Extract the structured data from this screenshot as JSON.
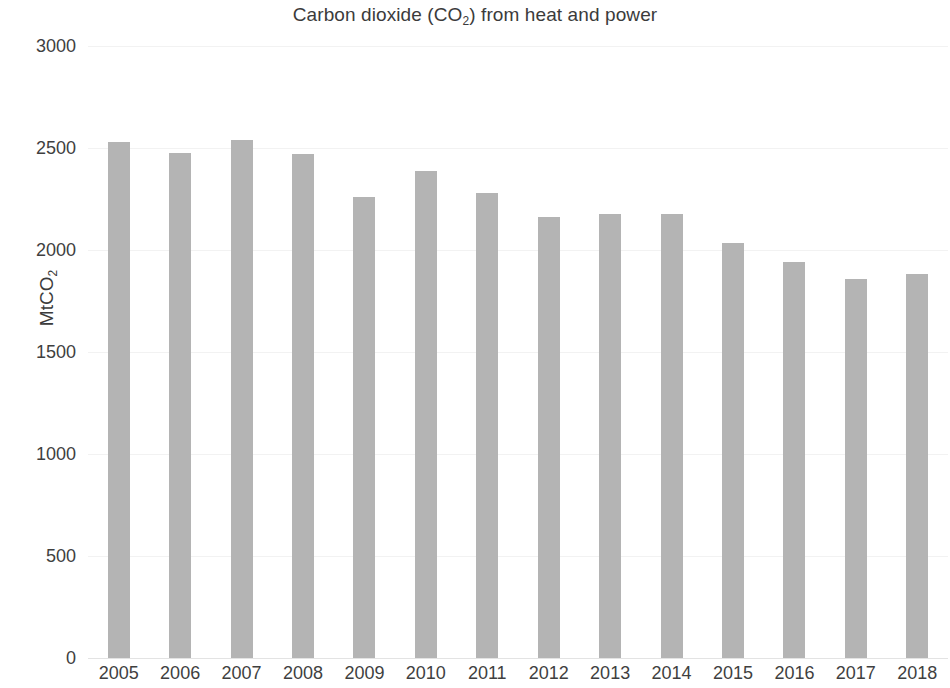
{
  "chart_data": {
    "type": "bar",
    "title": "Carbon dioxide (CO2) from heat and power",
    "title_prefix": "Carbon dioxide (CO",
    "title_sub": "2",
    "title_suffix": ") from heat and power",
    "xlabel": "",
    "ylabel": "MtCO2",
    "ylabel_prefix": "MtCO",
    "ylabel_sub": "2",
    "categories": [
      "2005",
      "2006",
      "2007",
      "2008",
      "2009",
      "2010",
      "2011",
      "2012",
      "2013",
      "2014",
      "2015",
      "2016",
      "2017",
      "2018"
    ],
    "values": [
      2530,
      2475,
      2540,
      2470,
      2260,
      2385,
      2280,
      2160,
      2175,
      2175,
      2035,
      1940,
      1860,
      1880
    ],
    "ylim": [
      0,
      3000
    ],
    "y_ticks": [
      0,
      500,
      1000,
      1500,
      2000,
      2500,
      3000
    ],
    "y_tick_labels": [
      "0",
      "500",
      "1000",
      "1500",
      "2000",
      "2500",
      "3000"
    ],
    "grid": true,
    "legend": false,
    "bar_color": "#b4b4b4",
    "background_color": "#ffffff",
    "text_color": "#3f3f3f"
  }
}
